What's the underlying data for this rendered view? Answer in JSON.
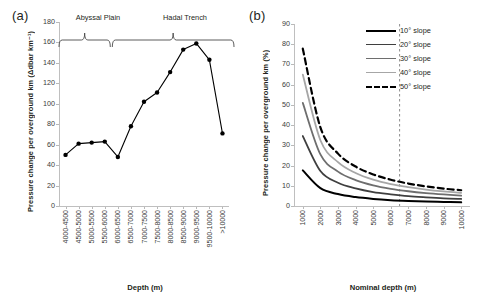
{
  "figure": {
    "panel_a_letter": "(a)",
    "panel_b_letter": "(b)"
  },
  "chart_data": [
    {
      "type": "line",
      "panel": "(a)",
      "title": "",
      "xlabel": "Depth (m)",
      "ylabel": "Pressure change per overground km (Δdbar km⁻¹)",
      "categories": [
        "4000-4500",
        "4500-5000",
        "5000-5500",
        "5500-6000",
        "6000-6500",
        "6500-7000",
        "7000-7500",
        "7500-8000",
        "8000-8500",
        "8500-9000",
        "9000-9500",
        "9500-10000",
        ">10000"
      ],
      "values": [
        50,
        61,
        62,
        63,
        48,
        78,
        102,
        111,
        131,
        153,
        159,
        143,
        71
      ],
      "ylim": [
        0,
        180
      ],
      "yticks": [
        0,
        20,
        40,
        60,
        80,
        100,
        120,
        140,
        160,
        180
      ],
      "grid": false,
      "marker": "filled-circle",
      "line_color": "#000000",
      "annotations": [
        {
          "label": "Abyssal Plain",
          "span_start": "4000-4500",
          "span_end": "5500-6000"
        },
        {
          "label": "Hadal Trench",
          "span_start": "6000-6500",
          "span_end": ">10000"
        }
      ]
    },
    {
      "type": "line",
      "panel": "(b)",
      "title": "",
      "xlabel": "Nominal depth (m)",
      "ylabel": "Pressure change per overground km (%)",
      "x": [
        1000,
        2000,
        3000,
        4000,
        5000,
        6000,
        7000,
        8000,
        9000,
        10000
      ],
      "xticks": [
        1000,
        2000,
        3000,
        4000,
        5000,
        6000,
        7000,
        8000,
        9000,
        10000
      ],
      "ylim": [
        0,
        90
      ],
      "yticks": [
        0,
        10,
        20,
        30,
        40,
        50,
        60,
        70,
        80,
        90
      ],
      "grid": false,
      "reference_line": {
        "x": 6500,
        "style": "dashed",
        "color": "#808080"
      },
      "legend_position": "top-right",
      "series": [
        {
          "name": "10° slope",
          "color": "#000000",
          "style": "solid",
          "width": 2.0,
          "values": [
            17.6,
            8.8,
            5.9,
            4.4,
            3.5,
            2.9,
            2.5,
            2.2,
            2.0,
            1.8
          ]
        },
        {
          "name": "20° slope",
          "color": "#3f3f3f",
          "style": "solid",
          "width": 1.8,
          "values": [
            34.6,
            17.3,
            11.5,
            8.7,
            6.9,
            5.8,
            4.9,
            4.3,
            3.8,
            3.5
          ]
        },
        {
          "name": "30° slope",
          "color": "#6e6e6e",
          "style": "solid",
          "width": 1.8,
          "values": [
            51.0,
            25.5,
            17.0,
            12.8,
            10.2,
            8.5,
            7.3,
            6.4,
            5.7,
            5.1
          ]
        },
        {
          "name": "40° slope",
          "color": "#a6a6a6",
          "style": "solid",
          "width": 1.8,
          "values": [
            65.0,
            32.5,
            21.7,
            16.3,
            13.0,
            10.8,
            9.3,
            8.1,
            7.2,
            6.5
          ]
        },
        {
          "name": "50° slope",
          "color": "#000000",
          "style": "dashed",
          "width": 2.2,
          "values": [
            77.8,
            38.9,
            25.9,
            19.5,
            15.6,
            13.0,
            11.1,
            9.7,
            8.6,
            7.8
          ]
        }
      ]
    }
  ]
}
